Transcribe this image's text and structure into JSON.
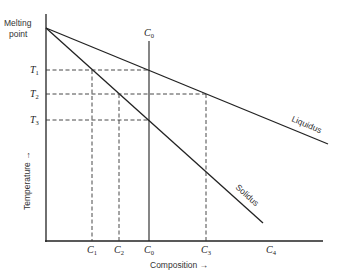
{
  "diagram": {
    "y_axis": {
      "top_label_line1": "Melting",
      "top_label_line2": "point",
      "title": "Temperature →"
    },
    "x_axis": {
      "title": "Composition →"
    },
    "temperature_levels": [
      {
        "name": "T",
        "sub": "1"
      },
      {
        "name": "T",
        "sub": "2"
      },
      {
        "name": "T",
        "sub": "3"
      }
    ],
    "compositions": [
      {
        "name": "C",
        "sub": "1"
      },
      {
        "name": "C",
        "sub": "2"
      },
      {
        "name": "C",
        "sub": "0"
      },
      {
        "name": "C",
        "sub": "3"
      },
      {
        "name": "C",
        "sub": "4"
      }
    ],
    "c0_top_label": {
      "name": "C",
      "sub": "0"
    },
    "curves": {
      "liquidus": "Liquidus",
      "solidus": "Solidus"
    },
    "colors": {
      "line": "#222222",
      "text": "#333333"
    }
  }
}
